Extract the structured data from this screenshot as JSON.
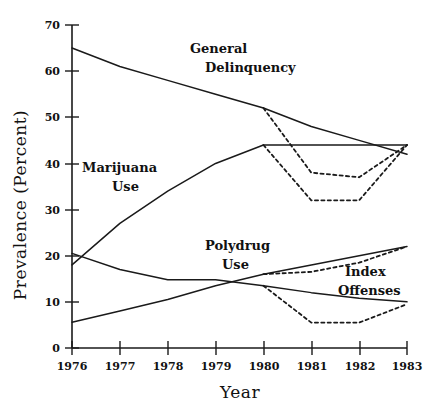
{
  "chart_data": {
    "type": "line",
    "title": "",
    "xlabel": "Year",
    "ylabel": "Prevalence (Percent)",
    "x": [
      1976,
      1977,
      1978,
      1979,
      1980,
      1981,
      1982,
      1983
    ],
    "xtick_labels": [
      "1976",
      "1977",
      "1978",
      "1979",
      "1980",
      "1981",
      "1982",
      "1983"
    ],
    "xlim": [
      1976,
      1983
    ],
    "ylim": [
      0,
      70
    ],
    "ytick_labels": [
      "0",
      "10",
      "20",
      "30",
      "40",
      "50",
      "60",
      "70"
    ],
    "yticks": [
      0,
      10,
      20,
      30,
      40,
      50,
      60,
      70
    ],
    "grid": false,
    "legend": "inline-annotations",
    "series": [
      {
        "name": "General Delinquency",
        "style": "solid",
        "x": [
          1976,
          1977,
          1978,
          1979,
          1980,
          1981,
          1982,
          1983
        ],
        "values": [
          65,
          61,
          58,
          55,
          52,
          48,
          45,
          42
        ]
      },
      {
        "name": "General Delinquency (dashed)",
        "style": "dashed",
        "x": [
          1980,
          1981,
          1982,
          1983
        ],
        "values": [
          52,
          38,
          37,
          44
        ]
      },
      {
        "name": "Marijuana Use",
        "style": "solid",
        "x": [
          1976,
          1977,
          1978,
          1979,
          1980,
          1981,
          1982,
          1983
        ],
        "values": [
          18,
          27,
          34,
          40,
          44,
          44,
          44,
          44
        ]
      },
      {
        "name": "Marijuana Use (dashed)",
        "style": "dashed",
        "x": [
          1980,
          1981,
          1982,
          1983
        ],
        "values": [
          44,
          32,
          32,
          44
        ]
      },
      {
        "name": "Polydrug Use",
        "style": "solid",
        "x": [
          1976,
          1977,
          1978,
          1979,
          1980,
          1981,
          1982,
          1983
        ],
        "values": [
          5.6,
          8,
          10.5,
          13.5,
          16,
          18,
          20,
          22
        ]
      },
      {
        "name": "Polydrug Use (dashed)",
        "style": "dashed",
        "x": [
          1980,
          1981,
          1982,
          1983
        ],
        "values": [
          16,
          16.5,
          18.5,
          22
        ]
      },
      {
        "name": "Index Offenses",
        "style": "solid",
        "x": [
          1976,
          1977,
          1978,
          1979,
          1980,
          1981,
          1982,
          1983
        ],
        "values": [
          20.5,
          17,
          14.8,
          14.8,
          13.5,
          12,
          10.8,
          10
        ]
      },
      {
        "name": "Index Offenses (dashed)",
        "style": "dashed",
        "x": [
          1980,
          1981,
          1982,
          1983
        ],
        "values": [
          13.5,
          5.5,
          5.5,
          9.5
        ]
      }
    ],
    "annotations": [
      {
        "id": "general-delinquency",
        "line1": "General",
        "line2": "Delinquency"
      },
      {
        "id": "marijuana-use",
        "line1": "Marijuana",
        "line2": "Use"
      },
      {
        "id": "polydrug-use",
        "line1": "Polydrug",
        "line2": "Use"
      },
      {
        "id": "index-offenses",
        "line1": "Index",
        "line2": "Offenses"
      }
    ]
  },
  "axes": {
    "y_title": "Prevalence (Percent)",
    "x_title": "Year"
  },
  "ytick_0": "0",
  "ytick_10": "10",
  "ytick_20": "20",
  "ytick_30": "30",
  "ytick_40": "40",
  "ytick_50": "50",
  "ytick_60": "60",
  "ytick_70": "70",
  "xtick_1976": "1976",
  "xtick_1977": "1977",
  "xtick_1978": "1978",
  "xtick_1979": "1979",
  "xtick_1980": "1980",
  "xtick_1981": "1981",
  "xtick_1982": "1982",
  "xtick_1983": "1983",
  "labels": {
    "gd1": "General",
    "gd2": "Delinquency",
    "mj1": "Marijuana",
    "mj2": "Use",
    "pd1": "Polydrug",
    "pd2": "Use",
    "io1": "Index",
    "io2": "Offenses"
  },
  "colors": {
    "line": "#1a1a1a",
    "axis": "#1a1a1a",
    "background": "#ffffff"
  }
}
